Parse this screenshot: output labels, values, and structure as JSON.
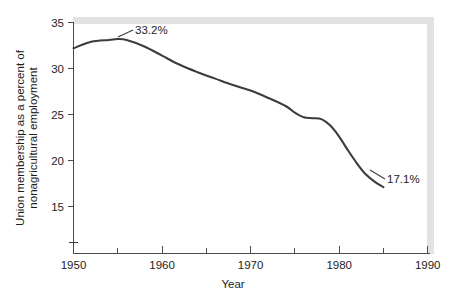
{
  "chart_data": {
    "type": "line",
    "title": "",
    "xlabel": "Year",
    "ylabel_line1": "Union membership as a percent of",
    "ylabel_line2": "nonagricultural employment",
    "xlim": [
      1950,
      1990
    ],
    "ylim": [
      13.2,
      35
    ],
    "y_axis_break": true,
    "grid": false,
    "legend": "none",
    "x_ticks_major": [
      1950,
      1960,
      1970,
      1980,
      1990
    ],
    "x_ticks_minor": [
      1955,
      1965,
      1975,
      1985
    ],
    "x_tick_labels": [
      "1950",
      "1960",
      "1970",
      "1980",
      "1990"
    ],
    "y_ticks": [
      15,
      20,
      25,
      30,
      35
    ],
    "y_tick_labels": [
      "15",
      "20",
      "25",
      "30",
      "35"
    ],
    "series": [
      {
        "name": "Union membership as a percent of nonagricultural employment",
        "color": "#3c3c3c",
        "x": [
          1950,
          1952,
          1954,
          1955,
          1956,
          1958,
          1960,
          1962,
          1964,
          1966,
          1968,
          1970,
          1972,
          1974,
          1975,
          1976,
          1977,
          1978,
          1979,
          1980,
          1981,
          1982,
          1983,
          1984,
          1985
        ],
        "values": [
          32.2,
          32.9,
          33.1,
          33.2,
          33.1,
          32.4,
          31.4,
          30.4,
          29.6,
          28.9,
          28.2,
          27.6,
          26.8,
          25.9,
          25.2,
          24.7,
          24.6,
          24.5,
          23.8,
          22.6,
          21.1,
          19.7,
          18.5,
          17.7,
          17.1
        ]
      }
    ],
    "annotations": [
      {
        "label": "33.2%",
        "x": 1955,
        "y": 33.2,
        "leader": true
      },
      {
        "label": "17.1%",
        "x": 1985,
        "y": 17.1,
        "leader": true
      }
    ]
  }
}
